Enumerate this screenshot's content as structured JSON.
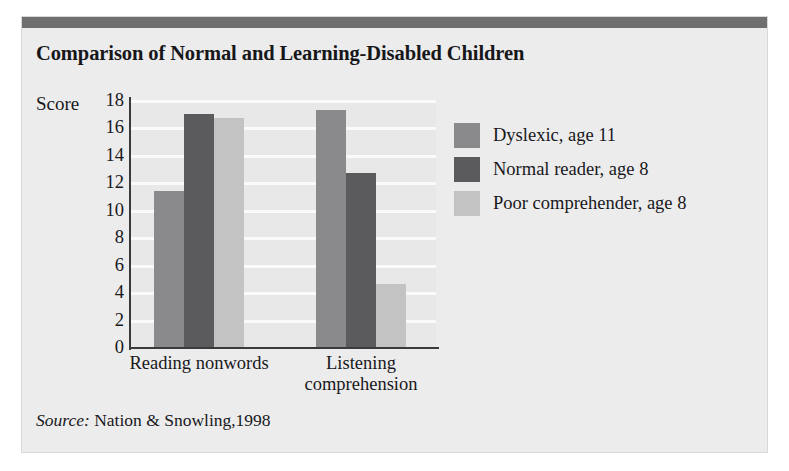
{
  "figure": {
    "title": "Comparison of Normal and Learning-Disabled Children",
    "source_prefix": "Source:",
    "source_text": " Nation & Snowling,1998"
  },
  "colors": {
    "panel_background": "#ececed",
    "top_rule": "#6f6f70",
    "plot_background": "#e8e8e9",
    "gridline": "#fafafa",
    "axis": "#3a3a3c",
    "series_dyslexic": "#8a8a8c",
    "series_normal_reader": "#5b5b5d",
    "series_poor_comprehender": "#c3c3c4",
    "text": "#18181b"
  },
  "chart_data": {
    "type": "bar",
    "title": "Comparison of Normal and Learning-Disabled Children",
    "xlabel": "",
    "ylabel": "Score",
    "categories": [
      "Reading nonwords",
      "Listening comprehension"
    ],
    "series": [
      {
        "name": "Dyslexic, age 11",
        "color": "#8a8a8c",
        "values": [
          11.4,
          17.3
        ]
      },
      {
        "name": "Normal reader, age 8",
        "color": "#5b5b5d",
        "values": [
          17.0,
          12.7
        ]
      },
      {
        "name": "Poor comprehender, age 8",
        "color": "#c3c3c4",
        "values": [
          16.7,
          4.6
        ]
      }
    ],
    "ylim": [
      0,
      18
    ],
    "ytick_step": 2,
    "yticks": [
      18,
      16,
      14,
      12,
      10,
      8,
      6,
      4,
      2,
      0
    ],
    "grid": true,
    "legend_position": "right",
    "annotations": [
      "Source: Nation & Snowling,1998"
    ]
  }
}
